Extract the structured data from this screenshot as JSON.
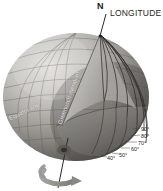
{
  "diagram": {
    "title": "LONGITUDE",
    "background_color": "#ffffff",
    "labels": {
      "longitude": "LONGITUDE",
      "north_pole": "N",
      "equator_line": "Equator line",
      "greenwich_meridian": "Greenwich meridian"
    },
    "degree_scale": {
      "unit": "degrees",
      "marks": [
        "90°",
        "80°",
        "70°",
        "60°",
        "50°",
        "40°"
      ]
    },
    "colors": {
      "sphere_light": "#cfcdca",
      "sphere_mid": "#9d9b98",
      "sphere_dark": "#6c6a68",
      "sphere_shadow": "#46443f",
      "cut_plane": "#7c7a77",
      "wedge_face": "#b9b7b4",
      "grid_line": "#55534f",
      "meridian_line": "#2e2c2a",
      "label_text": "#231f20",
      "overlay_text": "#efeeec",
      "axis": "#3a3835",
      "rotation_arrow": "#8a8885"
    },
    "elements": {
      "sphere": "globe-sphere",
      "graticule": "latitude-longitude-grid",
      "wedge": "longitude-wedge-cutaway",
      "meridians": "meridian-line-fan",
      "polar_axis": "polar-rotation-axis",
      "rotation_arrow": "rotation-direction-arrow"
    }
  }
}
